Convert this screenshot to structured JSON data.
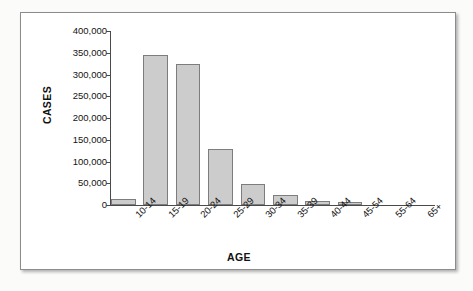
{
  "chart_data": {
    "type": "bar",
    "title": "",
    "xlabel": "AGE",
    "ylabel": "CASES",
    "categories": [
      "10-14",
      "15-19",
      "20-24",
      "25-29",
      "30-34",
      "35-39",
      "40-44",
      "45-54",
      "55-64",
      "65+"
    ],
    "values": [
      13000,
      346000,
      324000,
      128000,
      48000,
      22000,
      10000,
      7000,
      0,
      0
    ],
    "ylim": [
      0,
      400000
    ],
    "ytick_values": [
      0,
      50000,
      100000,
      150000,
      200000,
      250000,
      300000,
      350000,
      400000
    ],
    "ytick_labels": [
      "0",
      "50,000",
      "100,000",
      "150,000",
      "200,000",
      "250,000",
      "300,000",
      "350,000",
      "400,000"
    ],
    "grid": false,
    "legend": false,
    "bar_fill_color": "#cccccc",
    "bar_border_color": "#7d7d7d",
    "axis_color": "#4a4a4a",
    "text_color": "#131313"
  }
}
